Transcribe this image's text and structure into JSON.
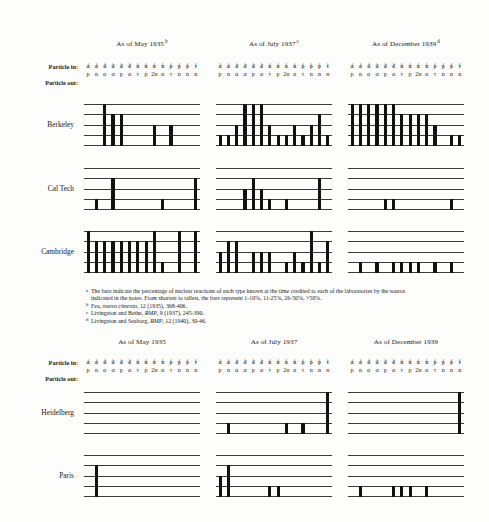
{
  "figure": {
    "particle_in_label": "Particle in:",
    "particle_out_label": "Particle out:",
    "tick_glyph": "|"
  },
  "reaction_columns": {
    "in": [
      "α",
      "α",
      "d",
      "d",
      "d",
      "d",
      "n",
      "n",
      "n",
      "n",
      "p",
      "p",
      "p",
      "τ"
    ],
    "out": [
      "p",
      "n",
      "α",
      "α",
      "p",
      "α",
      "τ",
      "p",
      "2n",
      "α",
      "τ",
      "n",
      "n",
      "n"
    ]
  },
  "sections": [
    {
      "id": "upper",
      "columns": [
        {
          "title": "As of May 1935",
          "note": "b"
        },
        {
          "title": "As of July 1937",
          "note": "c"
        },
        {
          "title": "As of December 1939",
          "note": "d"
        }
      ],
      "rows": [
        {
          "label": "Berkeley"
        },
        {
          "label": "Cal Tech"
        },
        {
          "label": "Cambridge"
        }
      ]
    },
    {
      "id": "lower",
      "columns": [
        {
          "title": "As of May 1935",
          "note": ""
        },
        {
          "title": "As of July 1937",
          "note": ""
        },
        {
          "title": "As of December 1939",
          "note": ""
        }
      ],
      "rows": [
        {
          "label": "Heidelberg"
        },
        {
          "label": "Paris"
        }
      ]
    }
  ],
  "chart_data": {
    "type": "bar",
    "xlabel": "Nuclear reaction (particle in → particle out)",
    "ylabel": "Percentage of reactions known",
    "ylim": [
      0,
      4
    ],
    "grid": true,
    "legend_position": "none",
    "bar_levels": {
      "0": "none",
      "1": "1-10%",
      "2": "11-25%",
      "3": "26-50%",
      "4": ">50%"
    },
    "categories": [
      "α,p",
      "α,n",
      "d,α",
      "d,α",
      "d,p",
      "d,α",
      "n,τ",
      "n,p",
      "n,2n",
      "n,α",
      "p,τ",
      "p,n",
      "p,n",
      "τ,n"
    ],
    "panels": [
      {
        "lab": "Berkeley",
        "date": "As of May 1935",
        "values": [
          0,
          0,
          4,
          3,
          3,
          0,
          0,
          0,
          2,
          0,
          2,
          0,
          0,
          0
        ]
      },
      {
        "lab": "Berkeley",
        "date": "As of July 1937",
        "values": [
          1,
          1,
          2,
          4,
          4,
          4,
          2,
          1,
          1,
          2,
          1,
          2,
          3,
          1
        ]
      },
      {
        "lab": "Berkeley",
        "date": "As of December 1939",
        "values": [
          4,
          4,
          4,
          4,
          4,
          4,
          3,
          3,
          3,
          3,
          2,
          0,
          1,
          1
        ]
      },
      {
        "lab": "Cal Tech",
        "date": "As of May 1935",
        "values": [
          0,
          1,
          0,
          3,
          0,
          0,
          0,
          0,
          0,
          1,
          0,
          0,
          0,
          3
        ]
      },
      {
        "lab": "Cal Tech",
        "date": "As of July 1937",
        "values": [
          0,
          0,
          0,
          2,
          3,
          2,
          1,
          0,
          1,
          0,
          0,
          0,
          3,
          0
        ]
      },
      {
        "lab": "Cal Tech",
        "date": "As of December 1939",
        "values": [
          0,
          0,
          0,
          0,
          1,
          1,
          0,
          0,
          0,
          0,
          0,
          0,
          1,
          0
        ]
      },
      {
        "lab": "Cambridge",
        "date": "As of May 1935",
        "values": [
          4,
          3,
          3,
          3,
          3,
          3,
          3,
          3,
          4,
          1,
          0,
          4,
          0,
          4
        ]
      },
      {
        "lab": "Cambridge",
        "date": "As of July 1937",
        "values": [
          2,
          3,
          3,
          0,
          2,
          2,
          2,
          0,
          1,
          2,
          1,
          4,
          1,
          3
        ]
      },
      {
        "lab": "Cambridge",
        "date": "As of December 1939",
        "values": [
          0,
          1,
          0,
          1,
          0,
          1,
          1,
          1,
          1,
          0,
          1,
          0,
          1,
          0
        ]
      },
      {
        "lab": "Heidelberg",
        "date": "As of May 1935",
        "values": [
          0,
          0,
          0,
          0,
          0,
          0,
          0,
          0,
          0,
          0,
          0,
          0,
          0,
          0
        ]
      },
      {
        "lab": "Heidelberg",
        "date": "As of July 1937",
        "values": [
          0,
          1,
          0,
          0,
          0,
          0,
          0,
          0,
          1,
          0,
          1,
          0,
          0,
          4
        ]
      },
      {
        "lab": "Heidelberg",
        "date": "As of December 1939",
        "values": [
          0,
          0,
          0,
          0,
          0,
          0,
          0,
          0,
          0,
          0,
          0,
          0,
          0,
          4
        ]
      },
      {
        "lab": "Paris",
        "date": "As of May 1935",
        "values": [
          0,
          3,
          0,
          0,
          0,
          0,
          0,
          0,
          0,
          0,
          0,
          0,
          0,
          0
        ]
      },
      {
        "lab": "Paris",
        "date": "As of July 1937",
        "values": [
          2,
          3,
          0,
          0,
          0,
          0,
          1,
          1,
          0,
          0,
          0,
          0,
          0,
          0
        ]
      },
      {
        "lab": "Paris",
        "date": "As of December 1939",
        "values": [
          0,
          1,
          0,
          0,
          0,
          1,
          1,
          1,
          0,
          1,
          0,
          0,
          0,
          0
        ]
      }
    ]
  },
  "footnotes": [
    {
      "mark": "a",
      "text": "The bars indicate the percentage of nuclear reactions of each type known at the time credited to each of the laboratories by the source indicated in the notes.  From shortest to tallest, the bars represent 1-10%, 11-25%, 26-50%, >50%."
    },
    {
      "mark": "b",
      "pre": "Fea, ",
      "italic": "nuovo cimento",
      "post": ", 12 (1935), 368-406."
    },
    {
      "mark": "c",
      "pre": "Livingston and Bethe, ",
      "italic": "RMP",
      "post": ", 9 (1937), 245-390."
    },
    {
      "mark": "d",
      "pre": "Livingston and Seaborg, ",
      "italic": "RMP",
      "post": ", 12 (1940), 30-46."
    }
  ]
}
